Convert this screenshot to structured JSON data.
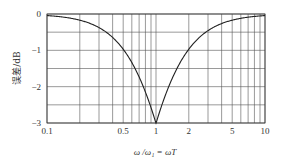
{
  "chart_data": {
    "type": "line",
    "title": "",
    "xlabel": "ω /ω₁ = ωT",
    "ylabel": "误差/dB",
    "xscale": "log",
    "xlim": [
      0.1,
      10
    ],
    "ylim": [
      -3,
      0
    ],
    "grid": true,
    "legend": null,
    "x_ticks": [
      0.1,
      0.5,
      1,
      2,
      5,
      10
    ],
    "x_tick_labels": [
      "0.1",
      "0.5",
      "1",
      "2",
      "5",
      "10"
    ],
    "y_ticks": [
      0,
      -1,
      -2,
      -3
    ],
    "y_tick_labels": [
      "0",
      "−1",
      "−2",
      "−3"
    ],
    "x_gridlines": [
      0.1,
      0.2,
      0.3,
      0.4,
      0.5,
      0.6,
      0.7,
      0.8,
      0.9,
      1,
      2,
      3,
      4,
      5,
      6,
      7,
      8,
      9,
      10
    ],
    "y_gridlines": [
      0,
      -0.5,
      -1,
      -1.5,
      -2,
      -2.5,
      -3
    ],
    "series": [
      {
        "name": "asymptote error",
        "x": [
          0.1,
          0.2,
          0.3,
          0.5,
          0.7,
          0.8,
          1,
          1.25,
          1.43,
          2,
          3.33,
          5,
          10
        ],
        "values": [
          -0.04,
          -0.17,
          -0.37,
          -0.97,
          -1.74,
          -2.15,
          -3.01,
          -2.15,
          -1.74,
          -0.97,
          -0.37,
          -0.17,
          -0.04
        ]
      }
    ]
  },
  "labels": {
    "ylabel": "误差/dB",
    "xlabel": "ω /ω₁ = ωT",
    "xticks": [
      "0.1",
      "0.5",
      "1",
      "2",
      "5",
      "10"
    ],
    "yticks": [
      "0",
      "−1",
      "−2",
      "−3"
    ]
  },
  "colors": {
    "line": "#222222",
    "grid": "#555555",
    "text": "#333333"
  }
}
